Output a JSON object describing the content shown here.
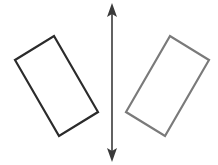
{
  "diagram": {
    "type": "reflection",
    "line_of_reflection": {
      "x": 112,
      "y1": 4,
      "y2": 161,
      "color": "#3a3a3a",
      "arrows": "both"
    },
    "preimage": {
      "label": "original rectangle",
      "points": "15,60 54,36 98,112 59,136",
      "stroke": "#2b2b2b"
    },
    "image": {
      "label": "reflected rectangle",
      "points": "209,60 170,36 126,112 165,136",
      "stroke": "#7a7a7a"
    }
  }
}
